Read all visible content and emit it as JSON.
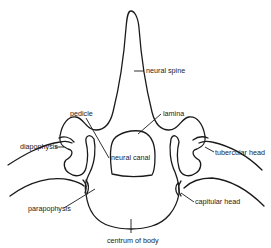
{
  "figure": {
    "labels": {
      "neural_spine": "neural spine",
      "pedicle": "pedicle",
      "lamina": "lamina",
      "neural_canal": "neural canal",
      "diapophysis": "diapophysis",
      "tubercular_head": "tubercular head",
      "parapophysis": "parapophysis",
      "capitular_head": "capitular head",
      "centrum": "centrum of body"
    },
    "colors": {
      "line": "#1a1a1a",
      "text": "#222222",
      "background": "#ffffff"
    }
  }
}
